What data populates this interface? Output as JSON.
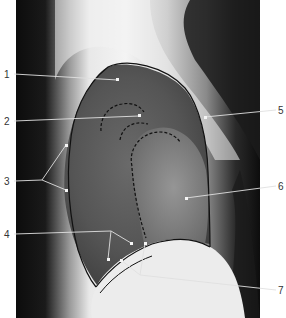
{
  "figure": {
    "image_type": "x-ray-lateral-chest",
    "labels": [
      {
        "number": "1",
        "side": "left",
        "text_x": 6,
        "text_y": 77
      },
      {
        "number": "2",
        "side": "left",
        "text_x": 6,
        "text_y": 124
      },
      {
        "number": "3",
        "side": "left",
        "text_x": 6,
        "text_y": 182
      },
      {
        "number": "4",
        "side": "left",
        "text_x": 6,
        "text_y": 236
      },
      {
        "number": "5",
        "side": "right",
        "text_x": 279,
        "text_y": 113
      },
      {
        "number": "6",
        "side": "right",
        "text_x": 279,
        "text_y": 189
      },
      {
        "number": "7",
        "side": "right",
        "text_x": 279,
        "text_y": 293
      }
    ]
  }
}
